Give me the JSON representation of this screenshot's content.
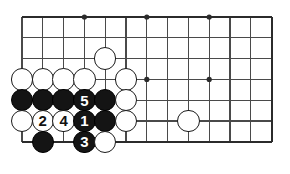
{
  "diagram": {
    "kind": "go-board-diagram",
    "board": {
      "origin_x": 22,
      "origin_y": 17,
      "spacing": 20.8,
      "columns": 13,
      "rows": 7,
      "line_color": "#4a4a4a",
      "edge_color": "#2b2b2b",
      "line_width": 1.1,
      "edge_width": 2.2,
      "background_color": "#ffffff",
      "edges": {
        "top": true,
        "left": false,
        "right": true,
        "bottom": true
      }
    },
    "star_points": [
      {
        "col": 3,
        "row": 0
      },
      {
        "col": 6,
        "row": 0
      },
      {
        "col": 9,
        "row": 0
      },
      {
        "col": 6,
        "row": 3
      },
      {
        "col": 9,
        "row": 3
      }
    ],
    "star_point_radius": 2.6,
    "stone_radius": 11.2,
    "stones": [
      {
        "col": 4,
        "row": 2,
        "color": "white",
        "label": ""
      },
      {
        "col": 0,
        "row": 3,
        "color": "white",
        "label": ""
      },
      {
        "col": 1,
        "row": 3,
        "color": "white",
        "label": ""
      },
      {
        "col": 2,
        "row": 3,
        "color": "white",
        "label": ""
      },
      {
        "col": 3,
        "row": 3,
        "color": "white",
        "label": ""
      },
      {
        "col": 5,
        "row": 3,
        "color": "white",
        "label": ""
      },
      {
        "col": 0,
        "row": 4,
        "color": "black",
        "label": ""
      },
      {
        "col": 1,
        "row": 4,
        "color": "black",
        "label": ""
      },
      {
        "col": 2,
        "row": 4,
        "color": "black",
        "label": ""
      },
      {
        "col": 3,
        "row": 4,
        "color": "black",
        "label": "5"
      },
      {
        "col": 4,
        "row": 4,
        "color": "black",
        "label": ""
      },
      {
        "col": 5,
        "row": 4,
        "color": "white",
        "label": ""
      },
      {
        "col": 0,
        "row": 5,
        "color": "white",
        "label": ""
      },
      {
        "col": 1,
        "row": 5,
        "color": "white",
        "label": "2"
      },
      {
        "col": 2,
        "row": 5,
        "color": "white",
        "label": "4"
      },
      {
        "col": 3,
        "row": 5,
        "color": "black",
        "label": "1"
      },
      {
        "col": 4,
        "row": 5,
        "color": "black",
        "label": ""
      },
      {
        "col": 5,
        "row": 5,
        "color": "white",
        "label": ""
      },
      {
        "col": 8,
        "row": 5,
        "color": "white",
        "label": ""
      },
      {
        "col": 1,
        "row": 6,
        "color": "black",
        "label": ""
      },
      {
        "col": 3,
        "row": 6,
        "color": "black",
        "label": "3"
      },
      {
        "col": 4,
        "row": 6,
        "color": "white",
        "label": ""
      }
    ],
    "move_sequence": [
      {
        "number": "1",
        "color": "black"
      },
      {
        "number": "2",
        "color": "white"
      },
      {
        "number": "3",
        "color": "black"
      },
      {
        "number": "4",
        "color": "white"
      },
      {
        "number": "5",
        "color": "black"
      }
    ]
  }
}
